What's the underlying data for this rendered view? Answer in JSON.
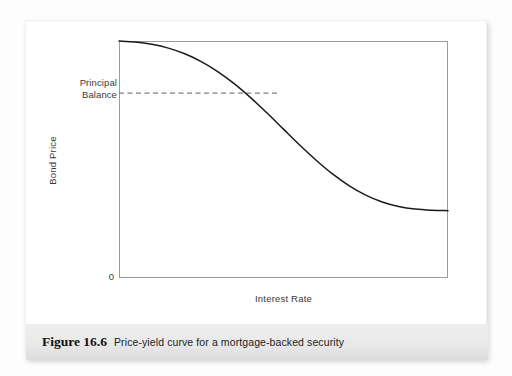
{
  "figure": {
    "caption_number": "Figure 16.6",
    "caption_text": "Price-yield curve for a mortgage-backed security"
  },
  "chart_data": {
    "type": "line",
    "title": "",
    "subtitle": "",
    "xlabel": "Interest Rate",
    "ylabel": "Bond Price",
    "origin_label": "0",
    "grid": false,
    "legend": null,
    "xlim": [
      0,
      100
    ],
    "ylim": [
      0,
      100
    ],
    "xticks": [],
    "yticks": [],
    "xticklabels": [],
    "yticklabels": [],
    "annotations": [
      {
        "name": "principal-balance",
        "line1": "Principal",
        "line2": "Balance",
        "value_y": 78,
        "style": "dashed-horizontal-line",
        "color": "#808080",
        "x_from": 0,
        "x_to": 48
      }
    ],
    "series": [
      {
        "name": "price-yield-curve",
        "color": "#1a1a1a",
        "x": [
          0,
          5,
          10,
          15,
          20,
          25,
          30,
          35,
          40,
          45,
          50,
          55,
          60,
          65,
          70,
          75,
          80,
          85,
          90,
          95,
          100
        ],
        "y": [
          100,
          99.6,
          98.6,
          97.0,
          94.6,
          91.3,
          87.1,
          82.0,
          76.1,
          69.6,
          62.8,
          56.0,
          49.6,
          43.8,
          38.9,
          35.0,
          32.1,
          30.2,
          29.1,
          28.6,
          28.4
        ]
      }
    ]
  }
}
